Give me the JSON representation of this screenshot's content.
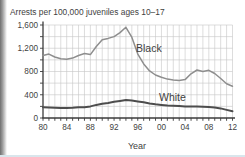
{
  "chart_data": {
    "type": "line",
    "title": "Arrests per 100,000 juveniles ages 10–17",
    "xlabel": "Year",
    "ylabel": "",
    "x_start_year": 1980,
    "x_end_year": 2012,
    "ylim": [
      0,
      1600
    ],
    "grid": {
      "on": true,
      "x_step_years": 1,
      "y_step": 200
    },
    "y_tick_values": [
      0,
      400,
      800,
      1200,
      1600
    ],
    "y_tick_labels": [
      "0",
      "400",
      "800",
      "1,200",
      "1,600"
    ],
    "y_minor_tick_step": 200,
    "x_tick_years": [
      1980,
      1984,
      1988,
      1992,
      1996,
      2000,
      2004,
      2008,
      2012
    ],
    "x_tick_labels": [
      "80",
      "84",
      "88",
      "92",
      "96",
      "00",
      "04",
      "08",
      "12"
    ],
    "years": [
      1980,
      1981,
      1982,
      1983,
      1984,
      1985,
      1986,
      1987,
      1988,
      1989,
      1990,
      1991,
      1992,
      1993,
      1994,
      1995,
      1996,
      1997,
      1998,
      1999,
      2000,
      2001,
      2002,
      2003,
      2004,
      2005,
      2006,
      2007,
      2008,
      2009,
      2010,
      2011,
      2012
    ],
    "legend_position": "inline-labels",
    "series": [
      {
        "name": "Black",
        "color": "#8e8e8e",
        "stroke_width": 1.5,
        "values": [
          1075,
          1100,
          1050,
          1020,
          1010,
          1030,
          1075,
          1110,
          1090,
          1230,
          1345,
          1370,
          1400,
          1470,
          1560,
          1390,
          1100,
          930,
          810,
          740,
          700,
          670,
          655,
          645,
          660,
          760,
          825,
          800,
          820,
          765,
          680,
          590,
          545
        ]
      },
      {
        "name": "White",
        "color": "#4d4d4d",
        "stroke_width": 2,
        "values": [
          185,
          180,
          175,
          170,
          172,
          178,
          185,
          185,
          200,
          225,
          245,
          260,
          280,
          295,
          310,
          300,
          285,
          270,
          250,
          235,
          225,
          215,
          210,
          205,
          200,
          200,
          200,
          195,
          190,
          180,
          165,
          140,
          115
        ]
      }
    ]
  }
}
